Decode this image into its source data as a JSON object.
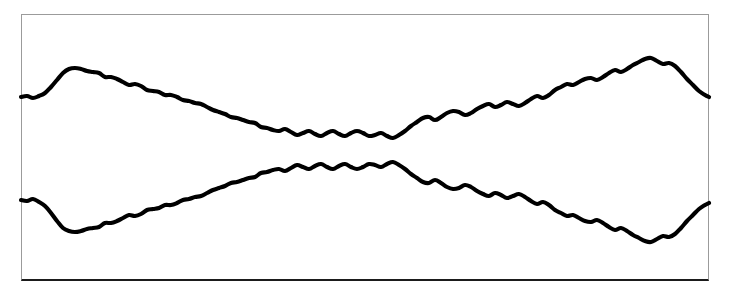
{
  "figure": {
    "title": "",
    "background_color": "#ffffff",
    "frame": {
      "x": 21,
      "y": 14,
      "width": 688,
      "height": 267,
      "border_color": "#9b9b9b",
      "bottom_border_color": "#1b1b1b",
      "bottom_border_width": 2,
      "border_width": 1
    }
  },
  "chart_data": {
    "type": "line",
    "title": "",
    "subtitle": "",
    "xlabel": "",
    "ylabel": "",
    "grid": false,
    "legend": null,
    "axis_ticks_visible": false,
    "tick_labels": [],
    "annotations": [],
    "xlim": [
      21,
      709
    ],
    "ylim": [
      14,
      281
    ],
    "stroke_color": "#000000",
    "stroke_width": 4.1,
    "series": [
      {
        "name": "upper-envelope",
        "x": [
          21,
          27,
          33,
          39,
          45,
          51,
          57,
          63,
          69,
          75,
          81,
          87,
          93,
          99,
          105,
          111,
          117,
          123,
          129,
          135,
          141,
          147,
          153,
          159,
          165,
          171,
          177,
          183,
          189,
          195,
          201,
          207,
          213,
          219,
          225,
          231,
          237,
          243,
          249,
          255,
          261,
          267,
          273,
          279,
          285,
          291,
          297,
          303,
          309,
          315,
          321,
          327,
          333,
          339,
          345,
          351,
          357,
          363,
          369,
          375,
          381,
          387,
          393,
          399,
          405,
          411,
          417,
          423,
          429,
          435,
          441,
          447,
          453,
          459,
          465,
          471,
          477,
          483,
          489,
          495,
          501,
          507,
          513,
          519,
          525,
          531,
          537,
          543,
          549,
          555,
          561,
          567,
          573,
          579,
          585,
          591,
          597,
          603,
          609,
          615,
          621,
          627,
          633,
          639,
          645,
          651,
          657,
          663,
          669,
          675,
          681,
          687,
          693,
          699,
          705,
          709
        ],
        "y": [
          97,
          96,
          98,
          96,
          93,
          87,
          80,
          73,
          69,
          68,
          69,
          71,
          72,
          73,
          77,
          77,
          79,
          82,
          85,
          84,
          86,
          90,
          91,
          92,
          95,
          95,
          97,
          100,
          101,
          103,
          104,
          107,
          110,
          112,
          114,
          117,
          118,
          120,
          122,
          123,
          127,
          128,
          130,
          131,
          129,
          132,
          135,
          133,
          131,
          134,
          136,
          133,
          131,
          134,
          136,
          133,
          131,
          133,
          136,
          135,
          133,
          136,
          138,
          135,
          131,
          126,
          122,
          118,
          117,
          120,
          117,
          113,
          111,
          112,
          115,
          113,
          109,
          106,
          104,
          107,
          105,
          102,
          104,
          106,
          103,
          99,
          96,
          98,
          95,
          90,
          87,
          84,
          85,
          82,
          79,
          78,
          80,
          77,
          73,
          70,
          72,
          69,
          65,
          62,
          59,
          58,
          61,
          64,
          63,
          66,
          72,
          79,
          85,
          91,
          95,
          97
        ]
      },
      {
        "name": "lower-envelope",
        "x": [
          21,
          27,
          33,
          39,
          45,
          51,
          57,
          63,
          69,
          75,
          81,
          87,
          93,
          99,
          105,
          111,
          117,
          123,
          129,
          135,
          141,
          147,
          153,
          159,
          165,
          171,
          177,
          183,
          189,
          195,
          201,
          207,
          213,
          219,
          225,
          231,
          237,
          243,
          249,
          255,
          261,
          267,
          273,
          279,
          285,
          291,
          297,
          303,
          309,
          315,
          321,
          327,
          333,
          339,
          345,
          351,
          357,
          363,
          369,
          375,
          381,
          387,
          393,
          399,
          405,
          411,
          417,
          423,
          429,
          435,
          441,
          447,
          453,
          459,
          465,
          471,
          477,
          483,
          489,
          495,
          501,
          507,
          513,
          519,
          525,
          531,
          537,
          543,
          549,
          555,
          561,
          567,
          573,
          579,
          585,
          591,
          597,
          603,
          609,
          615,
          621,
          627,
          633,
          639,
          645,
          651,
          657,
          663,
          669,
          675,
          681,
          687,
          693,
          699,
          705,
          709
        ],
        "y": [
          200,
          201,
          199,
          202,
          206,
          213,
          221,
          228,
          231,
          232,
          231,
          229,
          228,
          227,
          223,
          223,
          221,
          218,
          215,
          216,
          214,
          210,
          209,
          208,
          205,
          205,
          203,
          200,
          199,
          197,
          196,
          193,
          190,
          188,
          186,
          183,
          182,
          180,
          178,
          177,
          173,
          172,
          170,
          169,
          171,
          168,
          165,
          167,
          169,
          166,
          164,
          167,
          169,
          166,
          164,
          167,
          169,
          167,
          164,
          165,
          167,
          164,
          162,
          165,
          169,
          174,
          178,
          182,
          183,
          180,
          183,
          187,
          189,
          188,
          185,
          187,
          191,
          194,
          196,
          193,
          195,
          198,
          196,
          194,
          197,
          201,
          204,
          202,
          205,
          210,
          213,
          216,
          215,
          218,
          221,
          222,
          220,
          223,
          227,
          230,
          228,
          231,
          235,
          238,
          241,
          242,
          239,
          236,
          237,
          234,
          228,
          221,
          215,
          209,
          205,
          203
        ]
      }
    ]
  },
  "elements": {
    "plot_area_name": "waveform-plot-area",
    "upper_curve_name": "upper-envelope-curve",
    "lower_curve_name": "lower-envelope-curve"
  }
}
